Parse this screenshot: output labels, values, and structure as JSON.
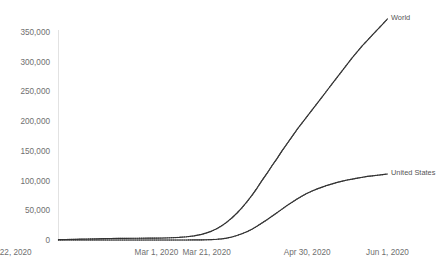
{
  "chart_data": {
    "type": "line",
    "title": "",
    "subtitle": "",
    "xlabel": "",
    "ylabel": "",
    "grid": false,
    "legend_position": "right-inline-labels",
    "xlim": [
      "Jan 22, 2020",
      "Jun 1, 2020"
    ],
    "ylim": [
      0,
      375000
    ],
    "y_ticks": [
      0,
      50000,
      100000,
      150000,
      200000,
      250000,
      300000,
      350000
    ],
    "y_tick_labels": [
      "0",
      "50,000",
      "100,000",
      "150,000",
      "200,000",
      "250,000",
      "300,000",
      "350,000"
    ],
    "x_ticks": [
      "Jan 22, 2020",
      "Mar 1, 2020",
      "Mar 21, 2020",
      "Apr 30, 2020",
      "Jun 1, 2020"
    ],
    "x_tick_labels": [
      "Jan 22, 2020",
      "Mar 1, 2020",
      "Mar 21, 2020",
      "Apr 30, 2020",
      "Jun 1, 2020"
    ],
    "x_tick_days": [
      0,
      39,
      59,
      99,
      131
    ],
    "x_total_days": 132,
    "marker": "dot",
    "line_color": "#3a3a3a",
    "series": [
      {
        "name": "World",
        "label": "World",
        "color": "#3a3a3a",
        "x_days": [
          0,
          3,
          6,
          9,
          12,
          15,
          18,
          21,
          24,
          27,
          30,
          33,
          36,
          39,
          42,
          45,
          48,
          51,
          54,
          57,
          59,
          61,
          63,
          65,
          67,
          69,
          71,
          73,
          75,
          77,
          79,
          81,
          83,
          85,
          87,
          89,
          91,
          93,
          95,
          97,
          99,
          101,
          103,
          105,
          107,
          109,
          111,
          113,
          115,
          117,
          119,
          121,
          123,
          125,
          127,
          129,
          131
        ],
        "values": [
          600,
          800,
          1100,
          1400,
          1700,
          2000,
          2300,
          2500,
          2700,
          2800,
          2900,
          3000,
          3100,
          3200,
          3400,
          3800,
          4400,
          5400,
          7000,
          9500,
          12000,
          15000,
          19000,
          24000,
          30000,
          37000,
          45000,
          54000,
          64000,
          75000,
          87000,
          100000,
          112000,
          125000,
          137000,
          150000,
          162000,
          174000,
          186000,
          197000,
          208000,
          219000,
          230000,
          241000,
          252000,
          263000,
          274000,
          285000,
          296000,
          307000,
          317000,
          327000,
          336000,
          345000,
          354000,
          363000,
          372000
        ]
      },
      {
        "name": "United States",
        "label": "United States",
        "color": "#3a3a3a",
        "x_days": [
          0,
          3,
          6,
          9,
          12,
          15,
          18,
          21,
          24,
          27,
          30,
          33,
          36,
          39,
          42,
          45,
          48,
          51,
          54,
          57,
          59,
          61,
          63,
          65,
          67,
          69,
          71,
          73,
          75,
          77,
          79,
          81,
          83,
          85,
          87,
          89,
          91,
          93,
          95,
          97,
          99,
          101,
          103,
          105,
          107,
          109,
          111,
          113,
          115,
          117,
          119,
          121,
          123,
          125,
          127,
          129,
          131
        ],
        "values": [
          0,
          0,
          0,
          0,
          0,
          0,
          0,
          0,
          0,
          0,
          0,
          0,
          0,
          0,
          0,
          0,
          0,
          0,
          100,
          200,
          400,
          700,
          1200,
          2000,
          3200,
          5000,
          7500,
          10500,
          14000,
          18000,
          23000,
          28500,
          34000,
          40000,
          46000,
          52000,
          58000,
          63500,
          69000,
          74000,
          78500,
          82500,
          86000,
          89000,
          92000,
          94500,
          97000,
          99000,
          101000,
          102500,
          104000,
          105500,
          107000,
          108000,
          109000,
          110000,
          111000
        ]
      }
    ]
  }
}
